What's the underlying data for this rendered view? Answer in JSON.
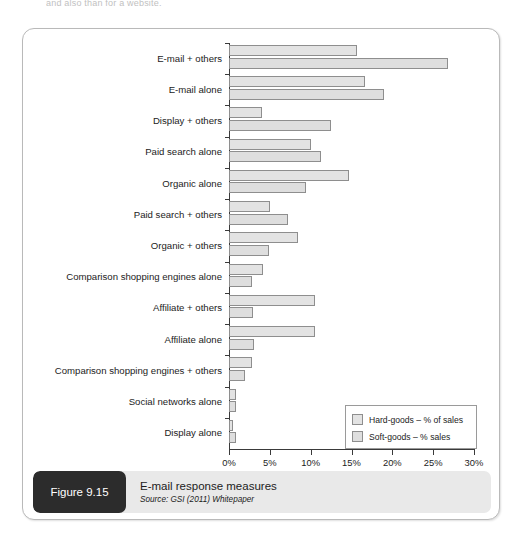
{
  "page": {
    "top_text": "and also than for a website."
  },
  "caption": {
    "tag": "Figure 9.15",
    "title": "E-mail response measures",
    "source": "Source: GSI (2011) Whitepaper"
  },
  "legend": {
    "position": "inside-bottom-right",
    "items": [
      {
        "label": "Hard-goods – % of sales",
        "color": "#e3e3e3"
      },
      {
        "label": "Soft-goods – % sales",
        "color": "#dedede"
      }
    ]
  },
  "chart_data": {
    "type": "bar",
    "orientation": "horizontal",
    "title": "E-mail response measures",
    "xlabel": "",
    "ylabel": "",
    "xlim": [
      0,
      30
    ],
    "xticks": [
      0,
      5,
      10,
      15,
      20,
      25,
      30
    ],
    "xticklabels": [
      "0%",
      "5%",
      "10%",
      "15%",
      "20%",
      "25%",
      "30%"
    ],
    "grid": false,
    "categories": [
      "E-mail + others",
      "E-mail alone",
      "Display + others",
      "Paid search alone",
      "Organic alone",
      "Paid search + others",
      "Organic + others",
      "Comparison shopping engines alone",
      "Affiliate + others",
      "Affiliate alone",
      "Comparison shopping engines + others",
      "Social networks alone",
      "Display alone"
    ],
    "series": [
      {
        "name": "Hard-goods – % of sales",
        "color": "#e3e3e3",
        "values": [
          15.7,
          16.7,
          4.0,
          10.0,
          14.7,
          5.0,
          8.4,
          4.2,
          10.5,
          10.5,
          2.8,
          0.8,
          0.5
        ]
      },
      {
        "name": "Soft-goods – % sales",
        "color": "#dedede",
        "values": [
          26.8,
          19.0,
          12.5,
          11.3,
          9.4,
          7.2,
          4.9,
          2.8,
          2.9,
          3.0,
          2.0,
          0.9,
          0.8
        ]
      }
    ]
  }
}
